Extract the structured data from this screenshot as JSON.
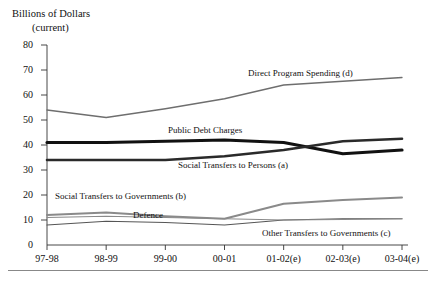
{
  "chart_data": {
    "type": "line",
    "title": "",
    "ylabel": "Billions of Dollars (current)",
    "ylabel_line1": "Billions of Dollars",
    "ylabel_line2": "(current)",
    "xlabel": "",
    "categories": [
      "97-98",
      "98-99",
      "99-00",
      "00-01",
      "01-02(e)",
      "02-03(e)",
      "03-04(e)"
    ],
    "ylim": [
      0,
      80
    ],
    "yticks": [
      0,
      10,
      20,
      30,
      40,
      50,
      60,
      70,
      80
    ],
    "ytick_labels": [
      "0",
      "10",
      "20",
      "30",
      "40",
      "50",
      "60",
      "70",
      "80"
    ],
    "grid": false,
    "legend_position": "inline-annotations",
    "series": [
      {
        "name": "Direct Program Spending (d)",
        "label": "Direct Program Spending (d)",
        "color": "#6e6e6e",
        "width": 1.3,
        "values": [
          54,
          51,
          54.5,
          58.5,
          64,
          65.5,
          67
        ],
        "label_x": 248,
        "label_y": 68
      },
      {
        "name": "Public Debt Charges",
        "label": "Public Debt Charges",
        "color": "#111111",
        "width": 3.2,
        "values": [
          41,
          41,
          41.5,
          42,
          41,
          36.5,
          38
        ],
        "label_x": 168,
        "label_y": 125
      },
      {
        "name": "Social Transfers to Persons (a)",
        "label": "Social Transfers to Persons (a)",
        "color": "#2a2a2a",
        "width": 2.6,
        "values": [
          34,
          34,
          34,
          35.5,
          38,
          41.5,
          42.5
        ],
        "label_x": 178,
        "label_y": 160
      },
      {
        "name": "Social Transfers to Governments (b)",
        "label": "Social Transfers to Governments (b)",
        "color": "#8a8a8a",
        "width": 2.0,
        "values": [
          12,
          13,
          11.5,
          10.5,
          16.5,
          18,
          19
        ],
        "label_x": 55,
        "label_y": 191
      },
      {
        "name": "Defence",
        "label": "Defence",
        "color": "#555555",
        "width": 1.2,
        "values": [
          8,
          9.5,
          9,
          8,
          10,
          10.5,
          10.5
        ],
        "label_x": 133,
        "label_y": 210
      },
      {
        "name": "Other Transfers to Governments (c)",
        "label": "Other Transfers to Governments (c)",
        "color": "#8a8a8a",
        "width": 1.2,
        "values": [
          11,
          11.5,
          11,
          10.5,
          10,
          10.2,
          10.5
        ],
        "label_x": 262,
        "label_y": 228
      }
    ]
  }
}
